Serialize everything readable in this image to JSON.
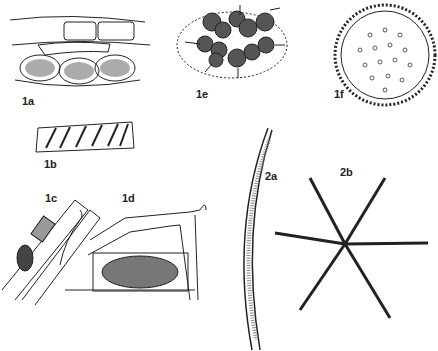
{
  "figure": {
    "type": "scientific illustration plate",
    "panels": [
      {
        "id": "1a",
        "label": "1a",
        "description": "cell layer with three oval stippled bodies"
      },
      {
        "id": "1b",
        "label": "1b",
        "description": "short banded filament segment"
      },
      {
        "id": "1c",
        "label": "1c",
        "description": "branched filaments with dark oval body and crosshatched segment"
      },
      {
        "id": "1d",
        "label": "1d",
        "description": "filament with large stippled oval body and lobed branch tips"
      },
      {
        "id": "1e",
        "label": "1e",
        "description": "colony of dark spherical cells with radiating bristles in dotted envelope"
      },
      {
        "id": "1f",
        "label": "1f",
        "description": "spherical colony covered with small rings and spiny margin"
      },
      {
        "id": "2a",
        "label": "2a",
        "description": "long curved striated diatom"
      },
      {
        "id": "2b",
        "label": "2b",
        "description": "star-shaped colony of six radiating rods"
      }
    ],
    "colors": {
      "ink": "#222222",
      "background": "#ffffff",
      "shade": "#555555"
    }
  }
}
